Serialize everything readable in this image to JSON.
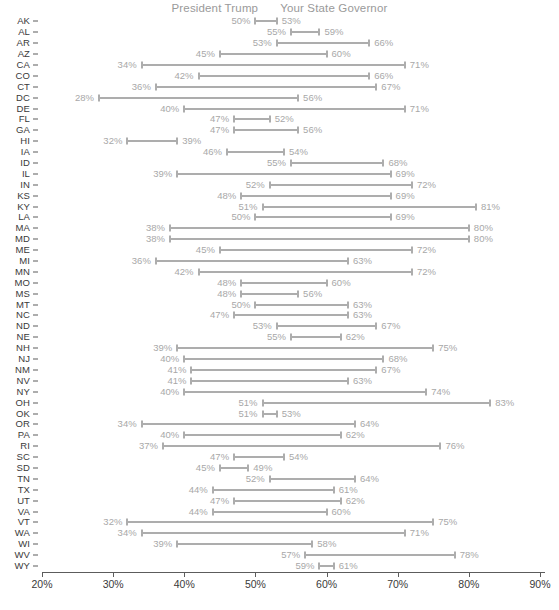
{
  "legend": {
    "items": [
      {
        "label": "President Trump"
      },
      {
        "label": "Your State Governor"
      }
    ]
  },
  "axis": {
    "x_ticks": [
      "20%",
      "30%",
      "40%",
      "50%",
      "60%",
      "70%",
      "80%",
      "90%"
    ],
    "x_min": 20,
    "x_max": 90,
    "x_unit": "%"
  },
  "footnote": {
    "text": ""
  },
  "colors": {
    "track": "#adadad",
    "value_label": "#a8a8a8",
    "state_label": "#3a3a3a",
    "legend_label": "#9a9a9a",
    "axis": "#5c5c5c",
    "background": "#ffffff"
  },
  "chart_data": {
    "type": "dumbbell",
    "title": "",
    "subtitle": "",
    "xlabel": "",
    "ylabel": "",
    "xlim": [
      20,
      90
    ],
    "grid": false,
    "legend_position": "top-center",
    "series": [
      {
        "name": "President Trump",
        "key": "trump"
      },
      {
        "name": "Your State Governor",
        "key": "governor"
      }
    ],
    "categories": [
      "AK",
      "AL",
      "AR",
      "AZ",
      "CA",
      "CO",
      "CT",
      "DC",
      "DE",
      "FL",
      "GA",
      "HI",
      "IA",
      "ID",
      "IL",
      "IN",
      "KS",
      "KY",
      "LA",
      "MA",
      "MD",
      "ME",
      "MI",
      "MN",
      "MO",
      "MS",
      "MT",
      "NC",
      "ND",
      "NE",
      "NH",
      "NJ",
      "NM",
      "NV",
      "NY",
      "OH",
      "OK",
      "OR",
      "PA",
      "RI",
      "SC",
      "SD",
      "TN",
      "TX",
      "UT",
      "VA",
      "VT",
      "WA",
      "WI",
      "WV",
      "WY"
    ],
    "rows": [
      {
        "state": "AK",
        "trump": 50,
        "governor": 53,
        "trump_label": "50%",
        "governor_label": "53%"
      },
      {
        "state": "AL",
        "trump": 55,
        "governor": 59,
        "trump_label": "55%",
        "governor_label": "59%"
      },
      {
        "state": "AR",
        "trump": 53,
        "governor": 66,
        "trump_label": "53%",
        "governor_label": "66%"
      },
      {
        "state": "AZ",
        "trump": 45,
        "governor": 60,
        "trump_label": "45%",
        "governor_label": "60%"
      },
      {
        "state": "CA",
        "trump": 34,
        "governor": 71,
        "trump_label": "34%",
        "governor_label": "71%"
      },
      {
        "state": "CO",
        "trump": 42,
        "governor": 66,
        "trump_label": "42%",
        "governor_label": "66%"
      },
      {
        "state": "CT",
        "trump": 36,
        "governor": 67,
        "trump_label": "36%",
        "governor_label": "67%"
      },
      {
        "state": "DC",
        "trump": 28,
        "governor": 56,
        "trump_label": "28%",
        "governor_label": "56%"
      },
      {
        "state": "DE",
        "trump": 40,
        "governor": 71,
        "trump_label": "40%",
        "governor_label": "71%"
      },
      {
        "state": "FL",
        "trump": 47,
        "governor": 52,
        "trump_label": "47%",
        "governor_label": "52%"
      },
      {
        "state": "GA",
        "trump": 47,
        "governor": 56,
        "trump_label": "47%",
        "governor_label": "56%"
      },
      {
        "state": "HI",
        "trump": 32,
        "governor": 39,
        "trump_label": "32%",
        "governor_label": "39%"
      },
      {
        "state": "IA",
        "trump": 46,
        "governor": 54,
        "trump_label": "46%",
        "governor_label": "54%"
      },
      {
        "state": "ID",
        "trump": 55,
        "governor": 68,
        "trump_label": "55%",
        "governor_label": "68%"
      },
      {
        "state": "IL",
        "trump": 39,
        "governor": 69,
        "trump_label": "39%",
        "governor_label": "69%"
      },
      {
        "state": "IN",
        "trump": 52,
        "governor": 72,
        "trump_label": "52%",
        "governor_label": "72%"
      },
      {
        "state": "KS",
        "trump": 48,
        "governor": 69,
        "trump_label": "48%",
        "governor_label": "69%"
      },
      {
        "state": "KY",
        "trump": 51,
        "governor": 81,
        "trump_label": "51%",
        "governor_label": "81%"
      },
      {
        "state": "LA",
        "trump": 50,
        "governor": 69,
        "trump_label": "50%",
        "governor_label": "69%"
      },
      {
        "state": "MA",
        "trump": 38,
        "governor": 80,
        "trump_label": "38%",
        "governor_label": "80%"
      },
      {
        "state": "MD",
        "trump": 38,
        "governor": 80,
        "trump_label": "38%",
        "governor_label": "80%"
      },
      {
        "state": "ME",
        "trump": 45,
        "governor": 72,
        "trump_label": "45%",
        "governor_label": "72%"
      },
      {
        "state": "MI",
        "trump": 36,
        "governor": 63,
        "trump_label": "36%",
        "governor_label": "63%"
      },
      {
        "state": "MN",
        "trump": 42,
        "governor": 72,
        "trump_label": "42%",
        "governor_label": "72%"
      },
      {
        "state": "MO",
        "trump": 48,
        "governor": 60,
        "trump_label": "48%",
        "governor_label": "60%"
      },
      {
        "state": "MS",
        "trump": 48,
        "governor": 56,
        "trump_label": "48%",
        "governor_label": "56%"
      },
      {
        "state": "MT",
        "trump": 50,
        "governor": 63,
        "trump_label": "50%",
        "governor_label": "63%"
      },
      {
        "state": "NC",
        "trump": 47,
        "governor": 63,
        "trump_label": "47%",
        "governor_label": "63%"
      },
      {
        "state": "ND",
        "trump": 53,
        "governor": 67,
        "trump_label": "53%",
        "governor_label": "67%"
      },
      {
        "state": "NE",
        "trump": 55,
        "governor": 62,
        "trump_label": "55%",
        "governor_label": "62%"
      },
      {
        "state": "NH",
        "trump": 39,
        "governor": 75,
        "trump_label": "39%",
        "governor_label": "75%"
      },
      {
        "state": "NJ",
        "trump": 40,
        "governor": 68,
        "trump_label": "40%",
        "governor_label": "68%"
      },
      {
        "state": "NM",
        "trump": 41,
        "governor": 67,
        "trump_label": "41%",
        "governor_label": "67%"
      },
      {
        "state": "NV",
        "trump": 41,
        "governor": 63,
        "trump_label": "41%",
        "governor_label": "63%"
      },
      {
        "state": "NY",
        "trump": 40,
        "governor": 74,
        "trump_label": "40%",
        "governor_label": "74%"
      },
      {
        "state": "OH",
        "trump": 51,
        "governor": 83,
        "trump_label": "51%",
        "governor_label": "83%"
      },
      {
        "state": "OK",
        "trump": 51,
        "governor": 53,
        "trump_label": "51%",
        "governor_label": "53%"
      },
      {
        "state": "OR",
        "trump": 34,
        "governor": 64,
        "trump_label": "34%",
        "governor_label": "64%"
      },
      {
        "state": "PA",
        "trump": 40,
        "governor": 62,
        "trump_label": "40%",
        "governor_label": "62%"
      },
      {
        "state": "RI",
        "trump": 37,
        "governor": 76,
        "trump_label": "37%",
        "governor_label": "76%"
      },
      {
        "state": "SC",
        "trump": 47,
        "governor": 54,
        "trump_label": "47%",
        "governor_label": "54%"
      },
      {
        "state": "SD",
        "trump": 45,
        "governor": 49,
        "trump_label": "45%",
        "governor_label": "49%"
      },
      {
        "state": "TN",
        "trump": 52,
        "governor": 64,
        "trump_label": "52%",
        "governor_label": "64%"
      },
      {
        "state": "TX",
        "trump": 44,
        "governor": 61,
        "trump_label": "44%",
        "governor_label": "61%"
      },
      {
        "state": "UT",
        "trump": 47,
        "governor": 62,
        "trump_label": "47%",
        "governor_label": "62%"
      },
      {
        "state": "VA",
        "trump": 44,
        "governor": 60,
        "trump_label": "44%",
        "governor_label": "60%"
      },
      {
        "state": "VT",
        "trump": 32,
        "governor": 75,
        "trump_label": "32%",
        "governor_label": "75%"
      },
      {
        "state": "WA",
        "trump": 34,
        "governor": 71,
        "trump_label": "34%",
        "governor_label": "71%"
      },
      {
        "state": "WI",
        "trump": 39,
        "governor": 58,
        "trump_label": "39%",
        "governor_label": "58%"
      },
      {
        "state": "WV",
        "trump": 57,
        "governor": 78,
        "trump_label": "57%",
        "governor_label": "78%"
      },
      {
        "state": "WY",
        "trump": 59,
        "governor": 61,
        "trump_label": "59%",
        "governor_label": "61%"
      }
    ]
  }
}
